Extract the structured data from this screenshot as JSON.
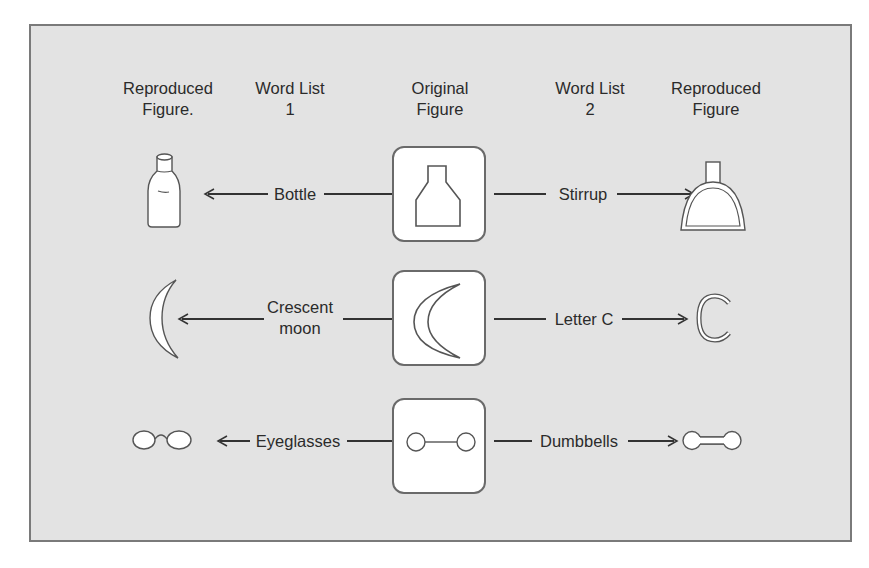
{
  "headers": [
    {
      "line1": "Reproduced",
      "line2": "Figure."
    },
    {
      "line1": "Word List",
      "line2": "1"
    },
    {
      "line1": "Original",
      "line2": "Figure"
    },
    {
      "line1": "Word List",
      "line2": "2"
    },
    {
      "line1": "Reproduced",
      "line2": "Figure"
    }
  ],
  "rows": [
    {
      "original_figure": "bottle-shape",
      "word_list_1": {
        "text": "Bottle"
      },
      "word_list_2": {
        "text": "Stirrup"
      },
      "reproduced_1": "bottle",
      "reproduced_2": "stirrup"
    },
    {
      "original_figure": "crescent-shape",
      "word_list_1": {
        "line1": "Crescent",
        "line2": "moon"
      },
      "word_list_2": {
        "text": "Letter C"
      },
      "reproduced_1": "crescent-moon",
      "reproduced_2": "letter-c"
    },
    {
      "original_figure": "two-circles-joined",
      "word_list_1": {
        "text": "Eyeglasses"
      },
      "word_list_2": {
        "text": "Dumbbells"
      },
      "reproduced_1": "eyeglasses",
      "reproduced_2": "dumbbells"
    }
  ],
  "colors": {
    "panel_background": "#e3e3e3",
    "border": "#7a7a7a",
    "figure_fill": "#ffffff",
    "ink": "#2b2b2b"
  }
}
